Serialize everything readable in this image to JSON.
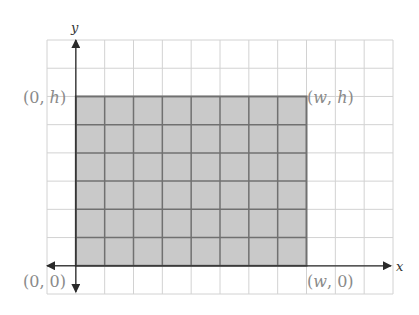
{
  "diagram": {
    "grid": {
      "columns": 12,
      "rows": 9,
      "origin_column": 1,
      "origin_row_from_bottom": 1
    },
    "rectangle": {
      "width_cells": 8,
      "height_cells": 6,
      "fill": "#c9c9c9",
      "stroke": "#707070"
    },
    "axes": {
      "x_label": "x",
      "y_label": "y",
      "color": "#2a2a2a"
    },
    "corner_labels": [
      {
        "id": "bottom-left",
        "prefix": "(0, ",
        "var": "0",
        "var_italic": false,
        "suffix": ")"
      },
      {
        "id": "top-left",
        "prefix": "(0, ",
        "var": "h",
        "var_italic": true,
        "suffix": ")"
      },
      {
        "id": "top-right",
        "prefix": "(",
        "var": "w",
        "var_italic": true,
        "mid": ", ",
        "var2": "h",
        "suffix": ")"
      },
      {
        "id": "bottom-right",
        "prefix": "(",
        "var": "w",
        "var_italic": true,
        "mid": ", ",
        "var2": "0",
        "suffix": ")"
      }
    ],
    "colors": {
      "grid_line": "#d2d2d2",
      "label": "#8a8a8a"
    }
  }
}
